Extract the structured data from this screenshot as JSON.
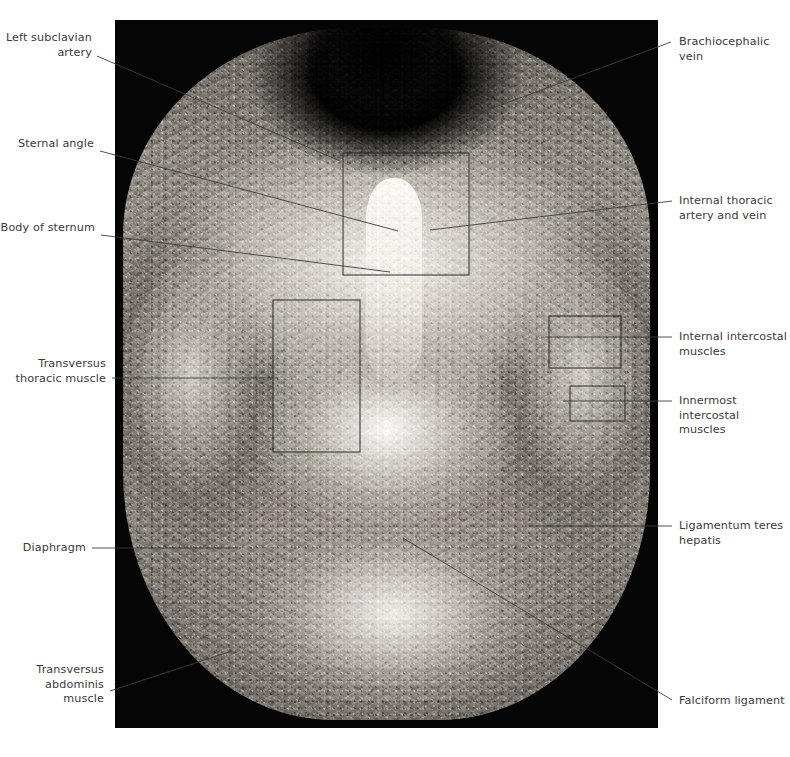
{
  "figure": {
    "plate_background": "#050505",
    "label_color": "#3a3a3a",
    "leader_color": "#3c3c3c",
    "roi_box_color": "#2b2b2b"
  },
  "labels": {
    "left_subclavian_artery": "Left subclavian\nartery",
    "sternal_angle": "Sternal angle",
    "body_of_sternum": "Body of sternum",
    "transversus_thoracic_muscle": "Transversus\nthoracic muscle",
    "diaphragm": "Diaphragm",
    "transversus_abdominis_muscle": "Transversus\nabdominis\nmuscle",
    "brachiocephalic_vein": "Brachiocephalic\nvein",
    "internal_thoracic_artery_and_vein": "Internal thoracic\nartery and vein",
    "internal_intercostal_muscles": "Internal intercostal\nmuscles",
    "innermost_intercostal_muscles": "Innermost\nintercostal\nmuscles",
    "ligamentum_teres_hepatis": "Ligamentum teres\nhepatis",
    "falciform_ligament": "Falciform ligament"
  },
  "structures": [
    {
      "name": "left-subclavian-artery",
      "side": "left",
      "label_key": "left_subclavian_artery"
    },
    {
      "name": "sternal-angle",
      "side": "left",
      "label_key": "sternal_angle"
    },
    {
      "name": "body-of-sternum",
      "side": "left",
      "label_key": "body_of_sternum"
    },
    {
      "name": "transversus-thoracic-muscle",
      "side": "left",
      "label_key": "transversus_thoracic_muscle"
    },
    {
      "name": "diaphragm",
      "side": "left",
      "label_key": "diaphragm"
    },
    {
      "name": "transversus-abdominis-muscle",
      "side": "left",
      "label_key": "transversus_abdominis_muscle"
    },
    {
      "name": "brachiocephalic-vein",
      "side": "right",
      "label_key": "brachiocephalic_vein"
    },
    {
      "name": "internal-thoracic-artery-and-vein",
      "side": "right",
      "label_key": "internal_thoracic_artery_and_vein"
    },
    {
      "name": "internal-intercostal-muscles",
      "side": "right",
      "label_key": "internal_intercostal_muscles"
    },
    {
      "name": "innermost-intercostal-muscles",
      "side": "right",
      "label_key": "innermost_intercostal_muscles"
    },
    {
      "name": "ligamentum-teres-hepatis",
      "side": "right",
      "label_key": "ligamentum_teres_hepatis"
    },
    {
      "name": "falciform-ligament",
      "side": "right",
      "label_key": "falciform_ligament"
    }
  ]
}
